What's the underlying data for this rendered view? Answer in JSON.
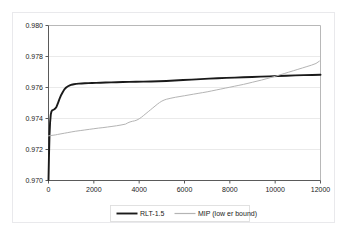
{
  "chart_data": {
    "type": "line",
    "title": "",
    "subtitle": "",
    "xlabel": "",
    "ylabel": "",
    "xlim": [
      0,
      12000
    ],
    "ylim": [
      0.97,
      0.98
    ],
    "xticks": [
      0,
      2000,
      4000,
      6000,
      8000,
      10000,
      12000
    ],
    "yticks": [
      0.97,
      0.972,
      0.974,
      0.976,
      0.978,
      0.98
    ],
    "xtick_labels": [
      "0",
      "2000",
      "4000",
      "6000",
      "8000",
      "10000",
      "12000"
    ],
    "ytick_labels": [
      "0.970",
      "0.972",
      "0.974",
      "0.976",
      "0.978",
      "0.980"
    ],
    "grid": {
      "horizontal": true,
      "vertical": false,
      "color": "#e4e4e4"
    },
    "legend": {
      "position": "bottom",
      "entries": [
        "RLT-1.5",
        "MIP (low er bound)"
      ]
    },
    "colors": {
      "series_rlt": "#1a1a1a",
      "series_mip": "#b4b4b4",
      "axis": "#5a5a5a",
      "grid": "#e4e4e4",
      "frame": "#e9e9ec",
      "text": "#1b1b1b",
      "background": "#ffffff"
    },
    "series": [
      {
        "name": "RLT-1.5",
        "color": "#1a1a1a",
        "width": 1.9,
        "x": [
          0,
          20,
          45,
          70,
          100,
          130,
          160,
          200,
          240,
          280,
          320,
          360,
          400,
          450,
          500,
          560,
          620,
          700,
          780,
          860,
          940,
          1020,
          1120,
          1220,
          1340,
          1460,
          1600,
          1760,
          1920,
          2100,
          2300,
          2520,
          2760,
          3000,
          3280,
          3560,
          3860,
          4180,
          4520,
          4860,
          5200,
          5560,
          5940,
          6320,
          6700,
          7080,
          7460,
          7840,
          8220,
          8600,
          8980,
          9360,
          9740,
          10120,
          10500,
          10880,
          11260,
          11640,
          12000
        ],
        "y": [
          0.97005,
          0.9715,
          0.97295,
          0.97375,
          0.97425,
          0.97445,
          0.97452,
          0.97455,
          0.97458,
          0.97462,
          0.97468,
          0.97478,
          0.97492,
          0.97512,
          0.97532,
          0.97552,
          0.97568,
          0.97588,
          0.976,
          0.97608,
          0.97614,
          0.97618,
          0.97621,
          0.97623,
          0.97625,
          0.97626,
          0.97627,
          0.97628,
          0.97629,
          0.9763,
          0.97631,
          0.97632,
          0.97633,
          0.97634,
          0.97635,
          0.97636,
          0.97637,
          0.97638,
          0.97639,
          0.9764,
          0.97642,
          0.97645,
          0.97648,
          0.97651,
          0.97654,
          0.97657,
          0.9766,
          0.97662,
          0.97664,
          0.97666,
          0.97668,
          0.9767,
          0.97672,
          0.97674,
          0.97676,
          0.97678,
          0.9768,
          0.97681,
          0.97682
        ]
      },
      {
        "name": "MIP (low er bound)",
        "color": "#b4b4b4",
        "width": 1.0,
        "x": [
          0,
          100,
          200,
          300,
          400,
          550,
          700,
          850,
          1000,
          1200,
          1400,
          1600,
          1800,
          2000,
          2200,
          2400,
          2600,
          2800,
          3000,
          3200,
          3400,
          3500,
          3600,
          3700,
          3800,
          3900,
          4000,
          4100,
          4200,
          4300,
          4400,
          4500,
          4600,
          4700,
          4800,
          4900,
          5000,
          5100,
          5200,
          5400,
          5600,
          5800,
          6000,
          6200,
          6400,
          6600,
          6800,
          7000,
          7200,
          7400,
          7600,
          7800,
          8000,
          8200,
          8400,
          8600,
          8800,
          9000,
          9200,
          9400,
          9600,
          9800,
          10000,
          10200,
          10400,
          10600,
          10800,
          11000,
          11200,
          11400,
          11600,
          11800,
          11950
        ],
        "y": [
          0.97288,
          0.9729,
          0.97292,
          0.97294,
          0.97297,
          0.97301,
          0.97305,
          0.97309,
          0.97313,
          0.97318,
          0.97322,
          0.97326,
          0.9733,
          0.97334,
          0.97338,
          0.97341,
          0.97345,
          0.97349,
          0.97353,
          0.97358,
          0.97364,
          0.97372,
          0.97378,
          0.97382,
          0.97385,
          0.9739,
          0.97398,
          0.97408,
          0.9742,
          0.97432,
          0.97444,
          0.97456,
          0.97468,
          0.9748,
          0.97492,
          0.97503,
          0.97512,
          0.97519,
          0.97524,
          0.97531,
          0.97537,
          0.97542,
          0.97547,
          0.97552,
          0.97557,
          0.97562,
          0.97567,
          0.97572,
          0.97578,
          0.97584,
          0.9759,
          0.97596,
          0.97602,
          0.97608,
          0.97614,
          0.9762,
          0.97627,
          0.97634,
          0.97641,
          0.97648,
          0.97656,
          0.97664,
          0.97672,
          0.97681,
          0.9769,
          0.97699,
          0.97708,
          0.97717,
          0.97726,
          0.97735,
          0.97744,
          0.97755,
          0.9777
        ]
      }
    ]
  }
}
